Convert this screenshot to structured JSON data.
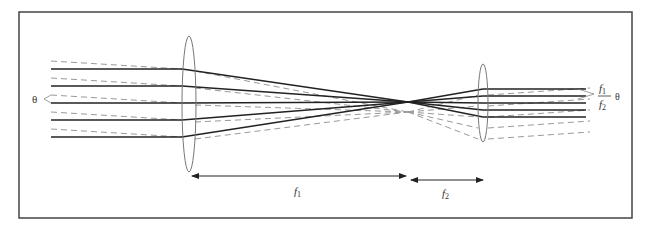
{
  "diagram": {
    "frame": {
      "x": 19,
      "y": 12,
      "width": 613,
      "height": 206,
      "stroke": "#444444"
    },
    "colors": {
      "solid_ray": "#222222",
      "dashed_ray": "#999999",
      "lens": "#777777",
      "arrow": "#222222"
    },
    "input_angle_label": "θ",
    "output_angle_label": {
      "numerator": "f",
      "numerator_sub": "1",
      "denominator": "f",
      "denominator_sub": "2",
      "theta": "θ"
    },
    "lens1": {
      "cx": 189,
      "cy": 104,
      "rx": 7,
      "ry": 68
    },
    "lens2": {
      "cx": 483,
      "cy": 103,
      "rx": 5,
      "ry": 39
    },
    "focal_point": {
      "x": 408,
      "y": 102
    },
    "dimension_f1": {
      "label": "f",
      "sub": "1",
      "x1": 190,
      "x2": 408,
      "y": 176
    },
    "dimension_f2": {
      "label": "f",
      "sub": "2",
      "x1": 410,
      "x2": 484,
      "y": 180
    }
  }
}
